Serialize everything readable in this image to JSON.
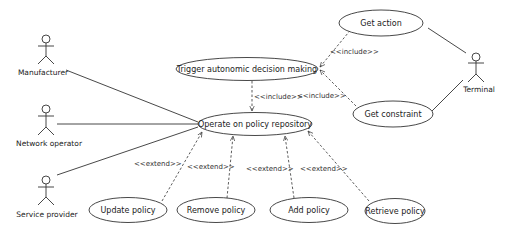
{
  "diagram": {
    "type": "UML use case diagram",
    "actors": [
      {
        "id": "manufacturer",
        "label": "Manufacturer"
      },
      {
        "id": "network_operator",
        "label": "Network operator"
      },
      {
        "id": "service_provider",
        "label": "Service provider"
      },
      {
        "id": "terminal",
        "label": "Terminal"
      }
    ],
    "use_cases": {
      "trigger": "Trigger autonomic decision making",
      "operate": "Operate on policy repository",
      "get_action": "Get action",
      "get_constraint": "Get constraint",
      "update": "Update policy",
      "remove": "Remove policy",
      "add": "Add policy",
      "retrieve": "Retrieve policy"
    },
    "stereotypes": {
      "include_trigger_operate": "<<include>>",
      "include_action": "<<include>>",
      "include_constraint": "<<include>>",
      "extend_update": "<<extend>>",
      "extend_remove": "<<extend>>",
      "extend_add": "<<extend>>",
      "extend_retrieve": "<<extend>>"
    }
  }
}
